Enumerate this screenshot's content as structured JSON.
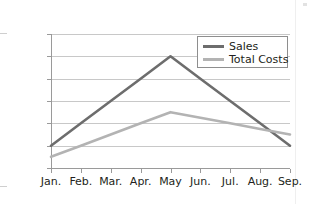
{
  "chart_data": {
    "type": "line",
    "title": "",
    "xlabel": "",
    "ylabel": "",
    "categories": [
      "Jan.",
      "Feb.",
      "Mar.",
      "Apr.",
      "May",
      "Jun.",
      "Jul.",
      "Aug.",
      "Sep."
    ],
    "series": [
      {
        "name": "Sales",
        "color": "#6d6d6d",
        "values": [
          200,
          400,
          600,
          800,
          1000,
          800,
          600,
          400,
          200
        ]
      },
      {
        "name": "Total Costs",
        "color": "#b3b3b3",
        "values": [
          100,
          200,
          300,
          400,
          500,
          450,
          400,
          350,
          300
        ]
      }
    ],
    "ylim": [
      0,
      1200
    ],
    "ytick_values": [
      0,
      200,
      400,
      600,
      800,
      1000,
      1200
    ],
    "ytick_labels": [
      "$0",
      "$200",
      "$400",
      "$600",
      "$800",
      "$1,000",
      "$1,200"
    ],
    "grid": true,
    "legend_position": "upper-right",
    "legend_entries": [
      "Sales",
      "Total Costs"
    ]
  },
  "colors": {
    "sales_line": "#6d6d6d",
    "costs_line": "#b3b3b3",
    "gridline": "#c8c8c8",
    "axis": "#9a9a9a",
    "text": "#231f20",
    "background": "#ffffff"
  }
}
